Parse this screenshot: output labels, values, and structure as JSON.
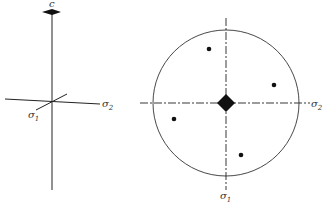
{
  "left_figure": {
    "top_label": "c",
    "axis1_label": "σ",
    "axis1_sub": "1",
    "axis2_label": "σ",
    "axis2_sub": "2"
  },
  "right_figure": {
    "axis1_label": "σ",
    "axis1_sub": "1",
    "axis2_label": "σ",
    "axis2_sub": "2",
    "center_symbol": "diamond (4-fold axis)",
    "points": [
      {
        "x": 209,
        "y": 49
      },
      {
        "x": 274,
        "y": 85
      },
      {
        "x": 174,
        "y": 119
      },
      {
        "x": 241,
        "y": 155
      }
    ]
  },
  "colors": {
    "ink": "#222222",
    "background": "#ffffff"
  }
}
